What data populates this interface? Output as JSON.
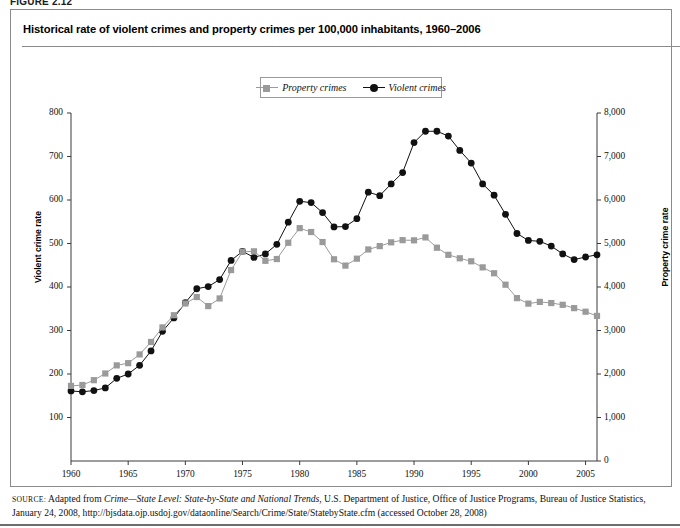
{
  "figure": {
    "label": "FIGURE 2.12",
    "title": "Historical rate of violent crimes and property crimes per 100,000 inhabitants, 1960–2006"
  },
  "legend": {
    "position": "top-center",
    "entries": [
      {
        "label": "Property crimes",
        "marker": "square-marker",
        "color": "#9a9a9a"
      },
      {
        "label": "Violent crimes",
        "marker": "circle-marker",
        "color": "#111111"
      }
    ]
  },
  "axes": {
    "left": {
      "title": "Violent crime rate",
      "ticks": [
        "0",
        "100",
        "200",
        "300",
        "400",
        "500",
        "600",
        "700",
        "800"
      ],
      "min": 0,
      "max": 800
    },
    "right": {
      "title": "Property crime rate",
      "ticks": [
        "0",
        "1,000",
        "2,000",
        "3,000",
        "4,000",
        "5,000",
        "6,000",
        "7,000",
        "8,000"
      ],
      "min": 0,
      "max": 8000
    },
    "bottom": {
      "ticks": [
        "1960",
        "1965",
        "1970",
        "1975",
        "1980",
        "1985",
        "1990",
        "1995",
        "2000",
        "2005"
      ]
    }
  },
  "source": {
    "prefix": "SOURCE:",
    "text_before_italic": " Adapted from ",
    "italic": "Crime—State Level: State-by-State and National Trends",
    "text_after_italic": ", U.S. Department of Justice, Office of Justice Programs, Bureau of Justice Statistics, January 24, 2008, http://bjsdata.ojp.usdoj.gov/dataonline/Search/Crime/State/StatebyState.cfm (accessed October 28, 2008)"
  },
  "chart_data": {
    "type": "line",
    "title": "Historical rate of violent crimes and property crimes per 100,000 inhabitants, 1960–2006",
    "xlabel": "",
    "ylabel": "Violent crime rate",
    "y2label": "Property crime rate",
    "ylim": [
      0,
      800
    ],
    "y2lim": [
      0,
      8000
    ],
    "xlim": [
      1960,
      2006
    ],
    "grid": false,
    "legend_position": "top-center",
    "x": [
      1960,
      1961,
      1962,
      1963,
      1964,
      1965,
      1966,
      1967,
      1968,
      1969,
      1970,
      1971,
      1972,
      1973,
      1974,
      1975,
      1976,
      1977,
      1978,
      1979,
      1980,
      1981,
      1982,
      1983,
      1984,
      1985,
      1986,
      1987,
      1988,
      1989,
      1990,
      1991,
      1992,
      1993,
      1994,
      1995,
      1996,
      1997,
      1998,
      1999,
      2000,
      2001,
      2002,
      2003,
      2004,
      2005,
      2006
    ],
    "series": [
      {
        "name": "Violent crimes",
        "axis": "left",
        "marker": "circle",
        "color": "#111111",
        "values": [
          161,
          159,
          162,
          168,
          190,
          200,
          220,
          253,
          298,
          329,
          364,
          396,
          401,
          417,
          461,
          482,
          468,
          476,
          498,
          549,
          597,
          594,
          571,
          538,
          539,
          557,
          618,
          610,
          637,
          663,
          732,
          758,
          758,
          747,
          714,
          685,
          637,
          611,
          567,
          523,
          507,
          505,
          494,
          476,
          463,
          469,
          474
        ]
      },
      {
        "name": "Property crimes",
        "axis": "right",
        "marker": "square",
        "color": "#9a9a9a",
        "values": [
          1726,
          1747,
          1858,
          2012,
          2198,
          2249,
          2450,
          2736,
          3071,
          3351,
          3621,
          3769,
          3561,
          3737,
          4390,
          4811,
          4820,
          4602,
          4643,
          5017,
          5353,
          5264,
          5033,
          4637,
          4492,
          4651,
          4863,
          4940,
          5027,
          5077,
          5073,
          5140,
          4903,
          4740,
          4660,
          4591,
          4451,
          4316,
          4053,
          3744,
          3618,
          3658,
          3631,
          3591,
          3514,
          3432,
          3335
        ]
      }
    ],
    "note": "Violent crime rate read on left axis (0-800); property crime rate read on right axis (0-8,000)."
  }
}
